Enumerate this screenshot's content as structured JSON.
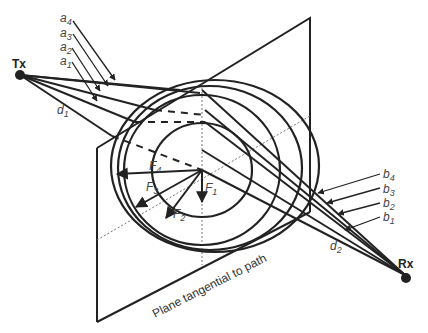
{
  "diagram": {
    "nodes": {
      "tx": {
        "label": "Tx"
      },
      "rx": {
        "label": "Rx"
      }
    },
    "plane_caption": "Plane tangential to path",
    "distances": {
      "d1": "d",
      "d1_sub": "1",
      "d2": "d",
      "d2_sub": "2"
    },
    "tx_side_labels": [
      {
        "base": "a",
        "sub": "4"
      },
      {
        "base": "a",
        "sub": "3"
      },
      {
        "base": "a",
        "sub": "2"
      },
      {
        "base": "a",
        "sub": "1"
      }
    ],
    "rx_side_labels": [
      {
        "base": "b",
        "sub": "4"
      },
      {
        "base": "b",
        "sub": "3"
      },
      {
        "base": "b",
        "sub": "2"
      },
      {
        "base": "b",
        "sub": "1"
      }
    ],
    "zone_radii_labels": [
      {
        "base": "F",
        "sub": "1"
      },
      {
        "base": "F",
        "sub": "2"
      },
      {
        "base": "F",
        "sub": "3"
      },
      {
        "base": "F",
        "sub": "4"
      }
    ],
    "colors": {
      "line": "#222222",
      "guide": "#777777",
      "background": "#ffffff"
    }
  }
}
